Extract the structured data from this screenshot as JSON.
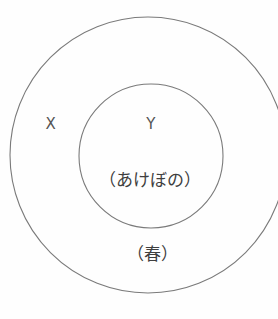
{
  "diagram": {
    "type": "nested-set-venn-diagram",
    "background_color": "#fefefe",
    "stroke_color": "#7a7a7a",
    "text_color": "#4a4a4a",
    "outer_set": {
      "label": "X",
      "term": "（春）",
      "center_x": 148,
      "center_y": 155,
      "radius": 138
    },
    "inner_set": {
      "label": "Y",
      "term": "（あけぼの）",
      "center_x": 151,
      "center_y": 156,
      "radius": 72
    }
  }
}
